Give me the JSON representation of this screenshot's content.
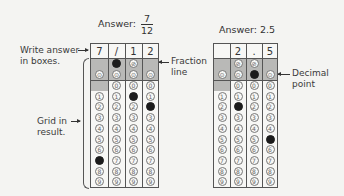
{
  "left_example": {
    "title_prefix": "Answer:",
    "numerator": "7",
    "denominator": "12",
    "boxes": [
      "7",
      "/",
      "1",
      "2"
    ],
    "filled": {
      "col0": "7",
      "col1": "/",
      "col2": "1",
      "col3": "2"
    }
  },
  "right_example": {
    "title": "Answer: 2.5",
    "boxes": [
      "",
      "2",
      ".",
      "5"
    ],
    "filled": {
      "col1": "2",
      "col2": ".",
      "col3": "5"
    }
  },
  "annotations": {
    "write_answer_line1": "Write answer",
    "write_answer_line2": "in boxes.",
    "grid_in_line1": "Grid in",
    "grid_in_line2": "result.",
    "fraction_line1": "Fraction",
    "fraction_line2": "line",
    "decimal_line1": "Decimal",
    "decimal_line2": "point"
  },
  "grid_symbols": {
    "slash": "⊘",
    "dot": "⊙",
    "digits": [
      "0",
      "1",
      "2",
      "3",
      "4",
      "5",
      "6",
      "7",
      "8",
      "9"
    ]
  },
  "colors": {
    "shade": "#b9b9b7",
    "filled_bubble": "#1c1c1c",
    "border": "#555555"
  }
}
